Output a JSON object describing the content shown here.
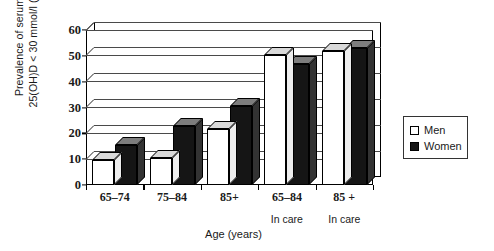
{
  "chart_data": {
    "type": "bar",
    "title": "",
    "xlabel": "Age (years)",
    "ylabel_line1": "Prevalence of serum",
    "ylabel_line2": "25(OH)D < 30 mmol/l (%)",
    "categories": [
      "65–74",
      "75–84",
      "85+",
      "65–84",
      "85 +"
    ],
    "category_sublabels": [
      "",
      "",
      "",
      "In care",
      "In care"
    ],
    "series": [
      {
        "name": "Men",
        "values": [
          9.5,
          10.5,
          21.5,
          50.5,
          52.0
        ],
        "color": "#ffffff"
      },
      {
        "name": "Women",
        "values": [
          15.5,
          23.0,
          30.5,
          47.0,
          53.0
        ],
        "color": "#151515"
      }
    ],
    "ylim": [
      0,
      60
    ],
    "yticks": [
      0,
      10,
      20,
      30,
      40,
      50,
      60
    ],
    "grid": true,
    "legend_position": "right"
  },
  "legend": {
    "items": [
      {
        "label": "Men"
      },
      {
        "label": "Women"
      }
    ]
  }
}
